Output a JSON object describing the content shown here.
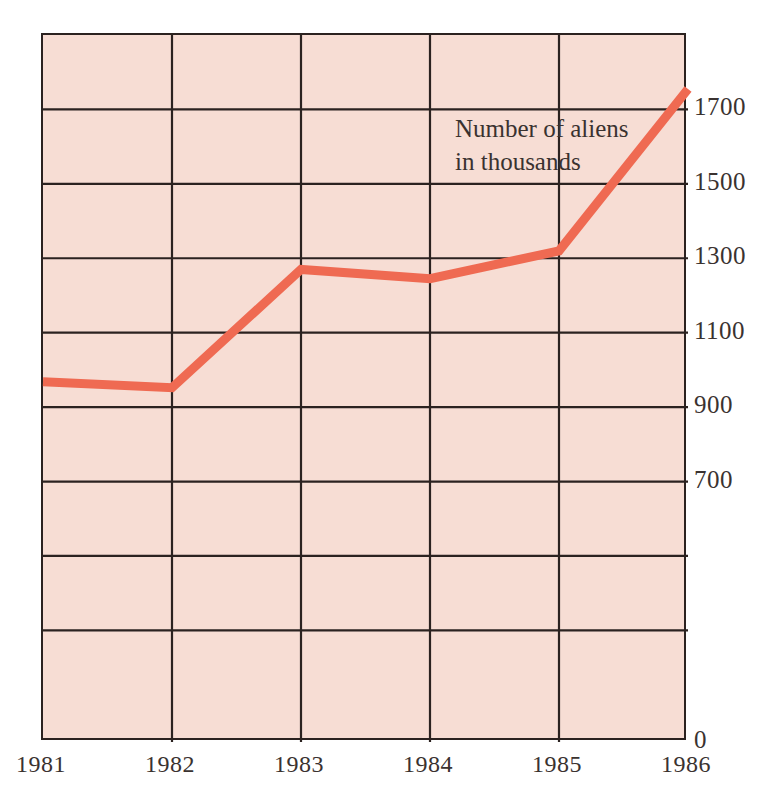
{
  "chart_data": {
    "type": "line",
    "title": "",
    "subtitle": "",
    "annotation": "Number of aliens\nin thousands",
    "annotation_lines": [
      "Number of aliens",
      "in thousands"
    ],
    "xlabel": "",
    "ylabel": "",
    "categories": [
      "1981",
      "1982",
      "1983",
      "1984",
      "1985",
      "1986"
    ],
    "x": [
      1981,
      1982,
      1983,
      1984,
      1985,
      1986
    ],
    "values": [
      968,
      952,
      1270,
      1245,
      1320,
      1755
    ],
    "series": [
      {
        "name": "Number of aliens in thousands",
        "values": [
          968,
          952,
          1270,
          1245,
          1320,
          1755
        ],
        "color": "#ef6a52"
      }
    ],
    "xlim": [
      1981,
      1986
    ],
    "ylim": [
      0,
      1900
    ],
    "ytick_labels": [
      "0",
      "700",
      "900",
      "1100",
      "1300",
      "1500",
      "1700"
    ],
    "ytick_values": [
      0,
      700,
      900,
      1100,
      1300,
      1500,
      1700
    ],
    "xtick_labels": [
      "1981",
      "1982",
      "1983",
      "1984",
      "1985",
      "1986"
    ],
    "gridline_values_y": [
      300,
      500,
      700,
      900,
      1100,
      1300,
      1500,
      1700
    ],
    "grid": true,
    "legend": "none",
    "legend_position": "none",
    "plot_background_color": "#f7ddd4",
    "grid_color": "#2b2220",
    "axis_color": "#2b2220",
    "page_background_color": "#ffffff",
    "text_color": "#3a3230"
  }
}
